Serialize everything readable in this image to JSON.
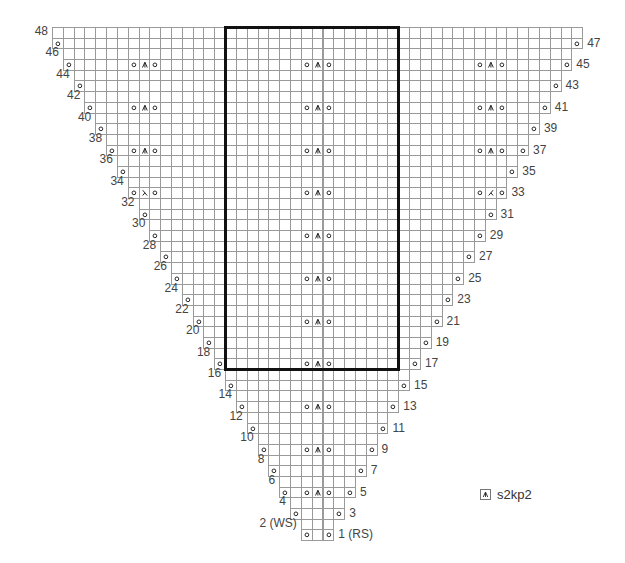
{
  "chart_data": {
    "type": "knitting-chart",
    "title": "",
    "grid": {
      "columns": 49,
      "rows": 48,
      "origin_x": 52,
      "origin_y": 27,
      "cell_w": 10.82,
      "cell_h": 10.69,
      "line_color": "#9a9a9a"
    },
    "symbols": {
      "o": "yo",
      "A": "s2kp2",
      "L": "ssk",
      "R": "k2tog",
      ".": "knit"
    },
    "rows": [
      {
        "n": 1,
        "label": "1 (RS)",
        "side": "right",
        "from": 24,
        "to": 26,
        "special": [
          [
            24,
            "o"
          ],
          [
            26,
            "o"
          ]
        ]
      },
      {
        "n": 2,
        "label": "2 (WS)",
        "side": "left",
        "from": 24,
        "to": 26,
        "special": []
      },
      {
        "n": 3,
        "label": "3",
        "side": "right",
        "from": 23,
        "to": 27,
        "special": [
          [
            23,
            "o"
          ],
          [
            27,
            "o"
          ]
        ]
      },
      {
        "n": 4,
        "label": "4",
        "side": "left",
        "from": 23,
        "to": 27,
        "special": []
      },
      {
        "n": 5,
        "label": "5",
        "side": "right",
        "from": 22,
        "to": 28,
        "special": [
          [
            22,
            "o"
          ],
          [
            24,
            "o"
          ],
          [
            25,
            "A"
          ],
          [
            26,
            "o"
          ],
          [
            28,
            "o"
          ]
        ]
      },
      {
        "n": 6,
        "label": "6",
        "side": "left",
        "from": 22,
        "to": 28,
        "special": []
      },
      {
        "n": 7,
        "label": "7",
        "side": "right",
        "from": 21,
        "to": 29,
        "special": [
          [
            21,
            "o"
          ],
          [
            29,
            "o"
          ]
        ]
      },
      {
        "n": 8,
        "label": "8",
        "side": "left",
        "from": 21,
        "to": 29,
        "special": []
      },
      {
        "n": 9,
        "label": "9",
        "side": "right",
        "from": 20,
        "to": 30,
        "special": [
          [
            20,
            "o"
          ],
          [
            24,
            "o"
          ],
          [
            25,
            "A"
          ],
          [
            26,
            "o"
          ],
          [
            30,
            "o"
          ]
        ]
      },
      {
        "n": 10,
        "label": "10",
        "side": "left",
        "from": 20,
        "to": 30,
        "special": []
      },
      {
        "n": 11,
        "label": "11",
        "side": "right",
        "from": 19,
        "to": 31,
        "special": [
          [
            19,
            "o"
          ],
          [
            31,
            "o"
          ]
        ]
      },
      {
        "n": 12,
        "label": "12",
        "side": "left",
        "from": 19,
        "to": 31,
        "special": []
      },
      {
        "n": 13,
        "label": "13",
        "side": "right",
        "from": 18,
        "to": 32,
        "special": [
          [
            18,
            "o"
          ],
          [
            24,
            "o"
          ],
          [
            25,
            "A"
          ],
          [
            26,
            "o"
          ],
          [
            32,
            "o"
          ]
        ]
      },
      {
        "n": 14,
        "label": "14",
        "side": "left",
        "from": 18,
        "to": 32,
        "special": []
      },
      {
        "n": 15,
        "label": "15",
        "side": "right",
        "from": 17,
        "to": 33,
        "special": [
          [
            17,
            "o"
          ],
          [
            33,
            "o"
          ]
        ]
      },
      {
        "n": 16,
        "label": "16",
        "side": "left",
        "from": 17,
        "to": 33,
        "special": []
      },
      {
        "n": 17,
        "label": "17",
        "side": "right",
        "from": 16,
        "to": 34,
        "special": [
          [
            16,
            "o"
          ],
          [
            24,
            "o"
          ],
          [
            25,
            "A"
          ],
          [
            26,
            "o"
          ],
          [
            34,
            "o"
          ]
        ]
      },
      {
        "n": 18,
        "label": "18",
        "side": "left",
        "from": 16,
        "to": 34,
        "special": []
      },
      {
        "n": 19,
        "label": "19",
        "side": "right",
        "from": 15,
        "to": 35,
        "special": [
          [
            15,
            "o"
          ],
          [
            35,
            "o"
          ]
        ]
      },
      {
        "n": 20,
        "label": "20",
        "side": "left",
        "from": 15,
        "to": 35,
        "special": []
      },
      {
        "n": 21,
        "label": "21",
        "side": "right",
        "from": 14,
        "to": 36,
        "special": [
          [
            14,
            "o"
          ],
          [
            24,
            "o"
          ],
          [
            25,
            "A"
          ],
          [
            26,
            "o"
          ],
          [
            36,
            "o"
          ]
        ]
      },
      {
        "n": 22,
        "label": "22",
        "side": "left",
        "from": 14,
        "to": 36,
        "special": []
      },
      {
        "n": 23,
        "label": "23",
        "side": "right",
        "from": 13,
        "to": 37,
        "special": [
          [
            13,
            "o"
          ],
          [
            37,
            "o"
          ]
        ]
      },
      {
        "n": 24,
        "label": "24",
        "side": "left",
        "from": 13,
        "to": 37,
        "special": []
      },
      {
        "n": 25,
        "label": "25",
        "side": "right",
        "from": 12,
        "to": 38,
        "special": [
          [
            12,
            "o"
          ],
          [
            24,
            "o"
          ],
          [
            25,
            "A"
          ],
          [
            26,
            "o"
          ],
          [
            38,
            "o"
          ]
        ]
      },
      {
        "n": 26,
        "label": "26",
        "side": "left",
        "from": 12,
        "to": 38,
        "special": []
      },
      {
        "n": 27,
        "label": "27",
        "side": "right",
        "from": 11,
        "to": 39,
        "special": [
          [
            11,
            "o"
          ],
          [
            39,
            "o"
          ]
        ]
      },
      {
        "n": 28,
        "label": "28",
        "side": "left",
        "from": 11,
        "to": 39,
        "special": []
      },
      {
        "n": 29,
        "label": "29",
        "side": "right",
        "from": 10,
        "to": 40,
        "special": [
          [
            10,
            "o"
          ],
          [
            24,
            "o"
          ],
          [
            25,
            "A"
          ],
          [
            26,
            "o"
          ],
          [
            40,
            "o"
          ]
        ]
      },
      {
        "n": 30,
        "label": "30",
        "side": "left",
        "from": 10,
        "to": 40,
        "special": []
      },
      {
        "n": 31,
        "label": "31",
        "side": "right",
        "from": 9,
        "to": 41,
        "special": [
          [
            9,
            "o"
          ],
          [
            41,
            "o"
          ]
        ]
      },
      {
        "n": 32,
        "label": "32",
        "side": "left",
        "from": 9,
        "to": 41,
        "special": []
      },
      {
        "n": 33,
        "label": "33",
        "side": "right",
        "from": 8,
        "to": 42,
        "special": [
          [
            8,
            "o"
          ],
          [
            9,
            "L"
          ],
          [
            10,
            "o"
          ],
          [
            24,
            "o"
          ],
          [
            25,
            "A"
          ],
          [
            26,
            "o"
          ],
          [
            40,
            "o"
          ],
          [
            41,
            "R"
          ],
          [
            42,
            "o"
          ]
        ]
      },
      {
        "n": 34,
        "label": "34",
        "side": "left",
        "from": 8,
        "to": 42,
        "special": []
      },
      {
        "n": 35,
        "label": "35",
        "side": "right",
        "from": 7,
        "to": 43,
        "special": [
          [
            7,
            "o"
          ],
          [
            43,
            "o"
          ]
        ]
      },
      {
        "n": 36,
        "label": "36",
        "side": "left",
        "from": 7,
        "to": 43,
        "special": []
      },
      {
        "n": 37,
        "label": "37",
        "side": "right",
        "from": 6,
        "to": 44,
        "special": [
          [
            6,
            "o"
          ],
          [
            8,
            "o"
          ],
          [
            9,
            "A"
          ],
          [
            10,
            "o"
          ],
          [
            24,
            "o"
          ],
          [
            25,
            "A"
          ],
          [
            26,
            "o"
          ],
          [
            40,
            "o"
          ],
          [
            41,
            "A"
          ],
          [
            42,
            "o"
          ],
          [
            44,
            "o"
          ]
        ]
      },
      {
        "n": 38,
        "label": "38",
        "side": "left",
        "from": 6,
        "to": 44,
        "special": []
      },
      {
        "n": 39,
        "label": "39",
        "side": "right",
        "from": 5,
        "to": 45,
        "special": [
          [
            5,
            "o"
          ],
          [
            45,
            "o"
          ]
        ]
      },
      {
        "n": 40,
        "label": "40",
        "side": "left",
        "from": 5,
        "to": 45,
        "special": []
      },
      {
        "n": 41,
        "label": "41",
        "side": "right",
        "from": 4,
        "to": 46,
        "special": [
          [
            4,
            "o"
          ],
          [
            8,
            "o"
          ],
          [
            9,
            "A"
          ],
          [
            10,
            "o"
          ],
          [
            24,
            "o"
          ],
          [
            25,
            "A"
          ],
          [
            26,
            "o"
          ],
          [
            40,
            "o"
          ],
          [
            41,
            "A"
          ],
          [
            42,
            "o"
          ],
          [
            46,
            "o"
          ]
        ]
      },
      {
        "n": 42,
        "label": "42",
        "side": "left",
        "from": 4,
        "to": 46,
        "special": []
      },
      {
        "n": 43,
        "label": "43",
        "side": "right",
        "from": 3,
        "to": 47,
        "special": [
          [
            3,
            "o"
          ],
          [
            47,
            "o"
          ]
        ]
      },
      {
        "n": 44,
        "label": "44",
        "side": "left",
        "from": 3,
        "to": 47,
        "special": []
      },
      {
        "n": 45,
        "label": "45",
        "side": "right",
        "from": 2,
        "to": 48,
        "special": [
          [
            2,
            "o"
          ],
          [
            8,
            "o"
          ],
          [
            9,
            "A"
          ],
          [
            10,
            "o"
          ],
          [
            24,
            "o"
          ],
          [
            25,
            "A"
          ],
          [
            26,
            "o"
          ],
          [
            40,
            "o"
          ],
          [
            41,
            "A"
          ],
          [
            42,
            "o"
          ],
          [
            48,
            "o"
          ]
        ]
      },
      {
        "n": 46,
        "label": "46",
        "side": "left",
        "from": 2,
        "to": 48,
        "special": []
      },
      {
        "n": 47,
        "label": "47",
        "side": "right",
        "from": 1,
        "to": 49,
        "special": [
          [
            1,
            "o"
          ],
          [
            49,
            "o"
          ]
        ]
      },
      {
        "n": 48,
        "label": "48",
        "side": "left",
        "from": 1,
        "to": 49,
        "special": []
      }
    ],
    "repeat_box": {
      "col_from": 17,
      "col_to": 32,
      "row_from": 17,
      "row_to": 48,
      "color": "#111111"
    },
    "legend": [
      {
        "symbol": "A",
        "label": "s2kp2"
      }
    ]
  },
  "legend": {
    "key_label": "s2kp2"
  }
}
